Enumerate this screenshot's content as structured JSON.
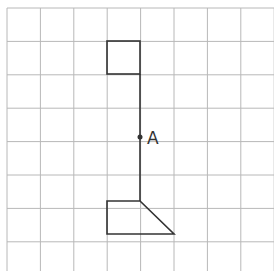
{
  "grid": {
    "origin_x": 7,
    "origin_y": 8,
    "cell": 33.4,
    "cols": 8,
    "rows": 8,
    "line_color": "#b8b8b8"
  },
  "shape_color": "#333333",
  "point": {
    "label": "A",
    "x": 140,
    "y": 137
  },
  "top_square": {
    "x1": 107,
    "y1": 41,
    "x2": 140,
    "y2": 74
  },
  "stem": {
    "x": 140,
    "y1": 74,
    "y2": 201
  },
  "bottom_shape": {
    "points": "107,201 140,201 174,234 107,234"
  }
}
